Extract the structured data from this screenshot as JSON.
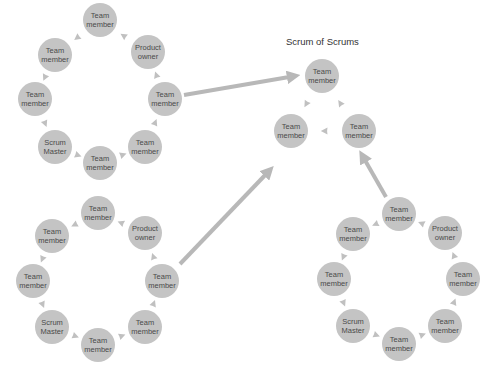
{
  "title": "Scrum of Scrums",
  "colors": {
    "node_fill": "#c4c4c4",
    "arrow": "#b8b8b8",
    "text": "#4a4a4a",
    "background": "#ffffff"
  },
  "clusters": [
    {
      "name": "team-a",
      "nodes": [
        {
          "label": "Team\nmember",
          "x": 100,
          "y": 20
        },
        {
          "label": "Product\nowner",
          "x": 148,
          "y": 52
        },
        {
          "label": "Team\nmember",
          "x": 165,
          "y": 99
        },
        {
          "label": "Team\nmember",
          "x": 145,
          "y": 147
        },
        {
          "label": "Team\nmember",
          "x": 100,
          "y": 163
        },
        {
          "label": "Scrum\nMaster",
          "x": 55,
          "y": 147
        },
        {
          "label": "Team\nmember",
          "x": 35,
          "y": 99
        },
        {
          "label": "Team\nmember",
          "x": 55,
          "y": 55
        }
      ]
    },
    {
      "name": "team-b",
      "nodes": [
        {
          "label": "Team\nmember",
          "x": 98,
          "y": 213
        },
        {
          "label": "Product\nowner",
          "x": 145,
          "y": 233
        },
        {
          "label": "Team\nmember",
          "x": 162,
          "y": 281
        },
        {
          "label": "Team\nmember",
          "x": 145,
          "y": 327
        },
        {
          "label": "Team\nmember",
          "x": 98,
          "y": 345
        },
        {
          "label": "Scrum\nMaster",
          "x": 52,
          "y": 327
        },
        {
          "label": "Team\nmember",
          "x": 33,
          "y": 281
        },
        {
          "label": "Team\nmember",
          "x": 52,
          "y": 236
        }
      ]
    },
    {
      "name": "team-c",
      "nodes": [
        {
          "label": "Team\nmember",
          "x": 399,
          "y": 214
        },
        {
          "label": "Product\nowner",
          "x": 445,
          "y": 233
        },
        {
          "label": "Team\nmember",
          "x": 463,
          "y": 279
        },
        {
          "label": "Team\nmember",
          "x": 445,
          "y": 326
        },
        {
          "label": "Team\nmember",
          "x": 399,
          "y": 344
        },
        {
          "label": "Scrum\nMaster",
          "x": 353,
          "y": 326
        },
        {
          "label": "Team\nmember",
          "x": 334,
          "y": 279
        },
        {
          "label": "Team\nmember",
          "x": 353,
          "y": 234
        }
      ]
    },
    {
      "name": "scrum-of-scrums",
      "nodes": [
        {
          "label": "Team\nmember",
          "x": 322,
          "y": 76
        },
        {
          "label": "Team\nmember",
          "x": 359,
          "y": 131
        },
        {
          "label": "Team\nmember",
          "x": 291,
          "y": 131
        }
      ]
    }
  ],
  "long_arrows": [
    {
      "from": [
        184,
        95
      ],
      "to": [
        295,
        76
      ]
    },
    {
      "from": [
        180,
        264
      ],
      "to": [
        270,
        170
      ]
    },
    {
      "from": [
        386,
        197
      ],
      "to": [
        362,
        155
      ]
    }
  ]
}
